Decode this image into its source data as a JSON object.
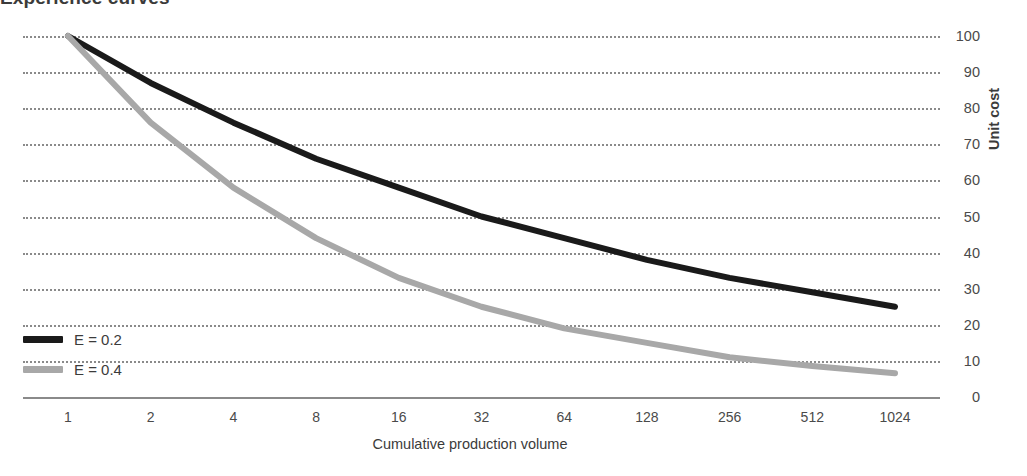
{
  "chart_data": {
    "type": "line",
    "title": "Experience curves",
    "xlabel": "Cumulative production volume",
    "ylabel": "Unit cost",
    "x": [
      1,
      2,
      4,
      8,
      16,
      32,
      64,
      128,
      256,
      512,
      1024
    ],
    "xtick_labels": [
      "1",
      "2",
      "4",
      "8",
      "16",
      "32",
      "64",
      "128",
      "256",
      "512",
      "1024"
    ],
    "xscale": "log2",
    "ytick_labels": [
      "100",
      "90",
      "80",
      "70",
      "60",
      "50",
      "40",
      "30",
      "20",
      "10",
      "0"
    ],
    "ylim": [
      0,
      100
    ],
    "grid": "horizontal-dotted",
    "legend_position": "bottom-left",
    "series": [
      {
        "name": "E = 0.2",
        "color": "#1a1a1a",
        "values": [
          100,
          87,
          76,
          66,
          58,
          50,
          44,
          38,
          33,
          29,
          25
        ]
      },
      {
        "name": "E = 0.4",
        "color": "#a8a8a8",
        "values": [
          100,
          76,
          58,
          44,
          33,
          25,
          19,
          15,
          11,
          8.6,
          6.6
        ]
      }
    ]
  },
  "axis": {
    "y_title": "Unit cost",
    "x_title": "Cumulative production volume",
    "y_ticks": [
      {
        "label": "100",
        "value": 100
      },
      {
        "label": "90",
        "value": 90
      },
      {
        "label": "80",
        "value": 80
      },
      {
        "label": "70",
        "value": 70
      },
      {
        "label": "60",
        "value": 60
      },
      {
        "label": "50",
        "value": 50
      },
      {
        "label": "40",
        "value": 40
      },
      {
        "label": "30",
        "value": 30
      },
      {
        "label": "20",
        "value": 20
      },
      {
        "label": "10",
        "value": 10
      },
      {
        "label": "0",
        "value": 0
      }
    ],
    "x_ticks": [
      {
        "label": "1"
      },
      {
        "label": "2"
      },
      {
        "label": "4"
      },
      {
        "label": "8"
      },
      {
        "label": "16"
      },
      {
        "label": "32"
      },
      {
        "label": "64"
      },
      {
        "label": "128"
      },
      {
        "label": "256"
      },
      {
        "label": "512"
      },
      {
        "label": "1024"
      }
    ]
  },
  "legend": {
    "items": [
      {
        "label": "E = 0.2",
        "color": "#1a1a1a"
      },
      {
        "label": "E = 0.4",
        "color": "#a8a8a8"
      }
    ]
  },
  "colors": {
    "series_dark": "#1a1a1a",
    "series_light": "#a8a8a8",
    "grid": "#8a8a8a",
    "text": "#404040"
  }
}
